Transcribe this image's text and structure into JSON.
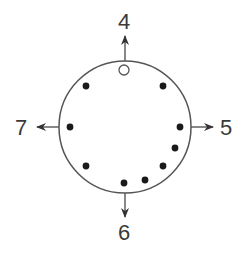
{
  "diagram": {
    "type": "circular-position-diagram",
    "circle": {
      "cx": 125,
      "cy": 127,
      "r": 66,
      "stroke": "#555555"
    },
    "labels": {
      "top": "4",
      "right": "5",
      "bottom": "6",
      "left": "7"
    },
    "arrows": [
      {
        "name": "arrow-up-4",
        "x1": 125,
        "y1": 61,
        "x2": 125,
        "y2": 36
      },
      {
        "name": "arrow-right-5",
        "x1": 191,
        "y1": 127,
        "x2": 213,
        "y2": 127
      },
      {
        "name": "arrow-down-6",
        "x1": 125,
        "y1": 193,
        "x2": 125,
        "y2": 217
      },
      {
        "name": "arrow-left-7",
        "x1": 59,
        "y1": 127,
        "x2": 37,
        "y2": 127
      }
    ],
    "open_marker": {
      "x": 124,
      "y": 70,
      "r": 5
    },
    "filled_dots": [
      {
        "x": 86,
        "y": 86
      },
      {
        "x": 163,
        "y": 86
      },
      {
        "x": 70,
        "y": 127
      },
      {
        "x": 180,
        "y": 127
      },
      {
        "x": 175,
        "y": 148
      },
      {
        "x": 86,
        "y": 166
      },
      {
        "x": 163,
        "y": 166
      },
      {
        "x": 145,
        "y": 180
      },
      {
        "x": 124,
        "y": 183
      }
    ],
    "colors": {
      "line": "#555555",
      "dot": "#1a1a1a",
      "text": "#3a3a3a"
    }
  }
}
